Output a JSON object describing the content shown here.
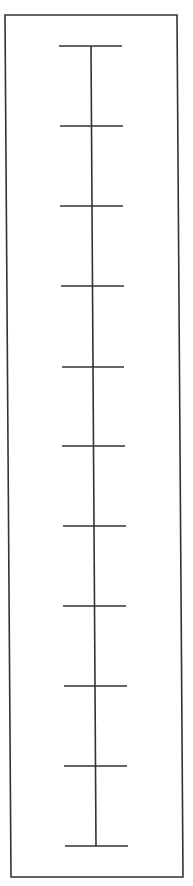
{
  "diagram": {
    "type": "vertical-scale-ruler",
    "stroke_color": "#333333",
    "background": "#ffffff",
    "frame": {
      "top_left": [
        5,
        15
      ],
      "top_right": [
        177,
        15
      ],
      "bottom_right": [
        183,
        877
      ],
      "bottom_left": [
        11,
        877
      ]
    },
    "axis": {
      "top": [
        91,
        46
      ],
      "bottom": [
        96,
        846
      ]
    },
    "tick_count": 11,
    "ticks": [
      {
        "y": 46,
        "x1": 59,
        "x2": 122
      },
      {
        "y": 126,
        "x1": 60,
        "x2": 123
      },
      {
        "y": 206,
        "x1": 60,
        "x2": 123
      },
      {
        "y": 286,
        "x1": 61,
        "x2": 124
      },
      {
        "y": 367,
        "x1": 62,
        "x2": 124
      },
      {
        "y": 446,
        "x1": 62,
        "x2": 125
      },
      {
        "y": 526,
        "x1": 63,
        "x2": 126
      },
      {
        "y": 606,
        "x1": 63,
        "x2": 126
      },
      {
        "y": 686,
        "x1": 64,
        "x2": 127
      },
      {
        "y": 766,
        "x1": 64,
        "x2": 127
      },
      {
        "y": 846,
        "x1": 65,
        "x2": 128
      }
    ]
  }
}
